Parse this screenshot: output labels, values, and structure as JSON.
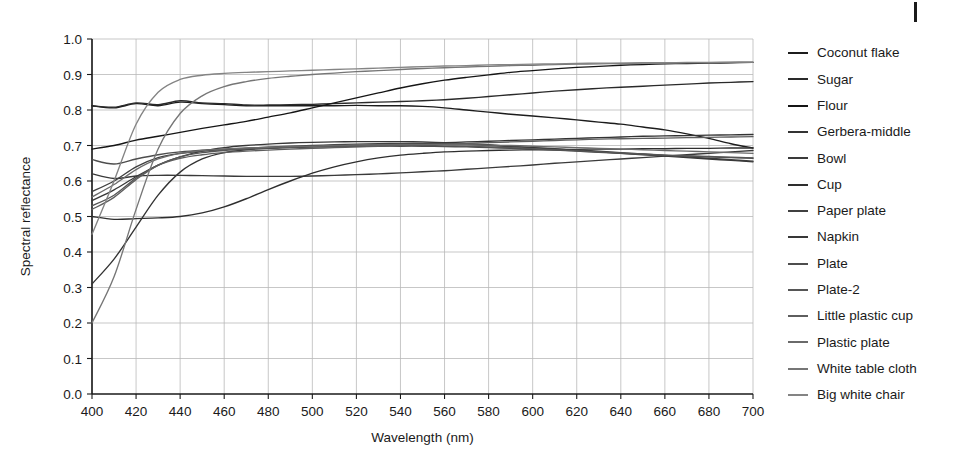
{
  "chart_data": {
    "type": "line",
    "title": "",
    "xlabel": "Wavelength (nm)",
    "ylabel": "Spectral reflectance",
    "xlim": [
      400,
      700
    ],
    "ylim": [
      0.0,
      1.0
    ],
    "grid": true,
    "legend_position": "right",
    "xticks": [
      400,
      420,
      440,
      460,
      480,
      500,
      520,
      540,
      560,
      580,
      600,
      620,
      640,
      660,
      680,
      700
    ],
    "yticks": [
      "0.0",
      "0.1",
      "0.2",
      "0.3",
      "0.4",
      "0.5",
      "0.6",
      "0.7",
      "0.8",
      "0.9",
      "1.0"
    ],
    "x": [
      400,
      410,
      420,
      430,
      440,
      450,
      460,
      470,
      480,
      490,
      500,
      510,
      520,
      530,
      540,
      550,
      560,
      570,
      580,
      590,
      600,
      610,
      620,
      630,
      640,
      650,
      660,
      670,
      680,
      690,
      700
    ],
    "series": [
      {
        "name": "Coconut flake",
        "color": "#1c1c1c",
        "values": [
          0.812,
          0.806,
          0.818,
          0.812,
          0.822,
          0.818,
          0.815,
          0.812,
          0.812,
          0.812,
          0.812,
          0.812,
          0.813,
          0.812,
          0.812,
          0.81,
          0.806,
          0.8,
          0.794,
          0.788,
          0.783,
          0.778,
          0.772,
          0.766,
          0.76,
          0.752,
          0.744,
          0.733,
          0.72,
          0.705,
          0.693
        ]
      },
      {
        "name": "Sugar",
        "color": "#2a2a2a",
        "values": [
          0.812,
          0.808,
          0.82,
          0.815,
          0.826,
          0.82,
          0.818,
          0.814,
          0.814,
          0.815,
          0.816,
          0.818,
          0.82,
          0.822,
          0.824,
          0.826,
          0.829,
          0.833,
          0.838,
          0.843,
          0.848,
          0.853,
          0.857,
          0.861,
          0.864,
          0.867,
          0.87,
          0.873,
          0.876,
          0.878,
          0.88
        ]
      },
      {
        "name": "Flour",
        "color": "#151515",
        "values": [
          0.69,
          0.7,
          0.715,
          0.726,
          0.737,
          0.748,
          0.758,
          0.768,
          0.78,
          0.792,
          0.806,
          0.82,
          0.834,
          0.848,
          0.862,
          0.874,
          0.884,
          0.892,
          0.899,
          0.906,
          0.911,
          0.916,
          0.92,
          0.923,
          0.926,
          0.928,
          0.93,
          0.931,
          0.932,
          0.933,
          0.934
        ]
      },
      {
        "name": "Gerbera-middle",
        "color": "#333333",
        "values": [
          0.31,
          0.38,
          0.47,
          0.56,
          0.625,
          0.662,
          0.68,
          0.688,
          0.692,
          0.694,
          0.696,
          0.698,
          0.7,
          0.702,
          0.704,
          0.706,
          0.708,
          0.71,
          0.712,
          0.714,
          0.716,
          0.718,
          0.72,
          0.722,
          0.724,
          0.726,
          0.727,
          0.728,
          0.729,
          0.73,
          0.731
        ]
      },
      {
        "name": "Bowl",
        "color": "#3a3a3a",
        "values": [
          0.62,
          0.607,
          0.614,
          0.616,
          0.616,
          0.615,
          0.614,
          0.613,
          0.613,
          0.613,
          0.614,
          0.616,
          0.618,
          0.62,
          0.623,
          0.626,
          0.629,
          0.633,
          0.637,
          0.641,
          0.645,
          0.65,
          0.654,
          0.658,
          0.662,
          0.666,
          0.67,
          0.674,
          0.678,
          0.682,
          0.686
        ]
      },
      {
        "name": "Cup",
        "color": "#2e2e2e",
        "values": [
          0.5,
          0.492,
          0.494,
          0.496,
          0.5,
          0.51,
          0.527,
          0.55,
          0.576,
          0.6,
          0.622,
          0.64,
          0.654,
          0.665,
          0.673,
          0.678,
          0.682,
          0.684,
          0.686,
          0.687,
          0.688,
          0.688,
          0.689,
          0.69,
          0.69,
          0.691,
          0.691,
          0.692,
          0.692,
          0.693,
          0.693
        ]
      },
      {
        "name": "Paper plate",
        "color": "#404040",
        "values": [
          0.57,
          0.6,
          0.64,
          0.666,
          0.678,
          0.684,
          0.688,
          0.692,
          0.695,
          0.698,
          0.7,
          0.702,
          0.704,
          0.705,
          0.706,
          0.706,
          0.705,
          0.703,
          0.7,
          0.697,
          0.694,
          0.691,
          0.688,
          0.684,
          0.68,
          0.676,
          0.672,
          0.668,
          0.664,
          0.66,
          0.656
        ]
      },
      {
        "name": "Napkin",
        "color": "#383838",
        "values": [
          0.545,
          0.575,
          0.612,
          0.645,
          0.668,
          0.684,
          0.694,
          0.7,
          0.704,
          0.707,
          0.709,
          0.71,
          0.711,
          0.711,
          0.711,
          0.71,
          0.708,
          0.705,
          0.702,
          0.698,
          0.694,
          0.69,
          0.686,
          0.682,
          0.678,
          0.674,
          0.67,
          0.666,
          0.662,
          0.658,
          0.654
        ]
      },
      {
        "name": "Plate",
        "color": "#4d4d4d",
        "values": [
          0.66,
          0.648,
          0.662,
          0.674,
          0.682,
          0.687,
          0.69,
          0.692,
          0.694,
          0.695,
          0.696,
          0.697,
          0.697,
          0.698,
          0.698,
          0.698,
          0.697,
          0.696,
          0.694,
          0.692,
          0.69,
          0.687,
          0.684,
          0.681,
          0.678,
          0.675,
          0.672,
          0.67,
          0.668,
          0.666,
          0.664
        ]
      },
      {
        "name": "Plate-2",
        "color": "#565656",
        "values": [
          0.53,
          0.56,
          0.608,
          0.645,
          0.668,
          0.68,
          0.686,
          0.69,
          0.693,
          0.695,
          0.697,
          0.698,
          0.699,
          0.7,
          0.7,
          0.7,
          0.699,
          0.698,
          0.696,
          0.694,
          0.691,
          0.688,
          0.685,
          0.682,
          0.679,
          0.676,
          0.673,
          0.671,
          0.669,
          0.667,
          0.665
        ]
      },
      {
        "name": "Little plastic cup",
        "color": "#5e5e5e",
        "values": [
          0.52,
          0.554,
          0.604,
          0.644,
          0.664,
          0.674,
          0.68,
          0.684,
          0.687,
          0.69,
          0.692,
          0.694,
          0.696,
          0.698,
          0.7,
          0.702,
          0.704,
          0.706,
          0.708,
          0.71,
          0.712,
          0.714,
          0.716,
          0.718,
          0.719,
          0.72,
          0.721,
          0.722,
          0.723,
          0.724,
          0.725
        ]
      },
      {
        "name": "Plastic plate",
        "color": "#6a6a6a",
        "values": [
          0.555,
          0.59,
          0.632,
          0.662,
          0.678,
          0.686,
          0.69,
          0.693,
          0.695,
          0.697,
          0.698,
          0.7,
          0.701,
          0.702,
          0.703,
          0.703,
          0.703,
          0.702,
          0.701,
          0.7,
          0.698,
          0.696,
          0.694,
          0.692,
          0.69,
          0.688,
          0.686,
          0.684,
          0.682,
          0.68,
          0.678
        ]
      },
      {
        "name": "White table cloth",
        "color": "#767676",
        "values": [
          0.2,
          0.33,
          0.52,
          0.69,
          0.79,
          0.84,
          0.866,
          0.88,
          0.889,
          0.895,
          0.9,
          0.904,
          0.908,
          0.911,
          0.914,
          0.917,
          0.919,
          0.921,
          0.923,
          0.925,
          0.926,
          0.928,
          0.929,
          0.93,
          0.931,
          0.932,
          0.932,
          0.933,
          0.933,
          0.934,
          0.934
        ]
      },
      {
        "name": "Big white chair",
        "color": "#848484",
        "values": [
          0.45,
          0.6,
          0.76,
          0.85,
          0.886,
          0.898,
          0.903,
          0.906,
          0.908,
          0.91,
          0.912,
          0.914,
          0.916,
          0.918,
          0.92,
          0.922,
          0.924,
          0.925,
          0.927,
          0.928,
          0.929,
          0.93,
          0.931,
          0.932,
          0.932,
          0.933,
          0.933,
          0.934,
          0.934,
          0.935,
          0.935
        ]
      }
    ]
  },
  "legend": {
    "items": [
      {
        "label": "Coconut flake"
      },
      {
        "label": "Sugar"
      },
      {
        "label": "Flour"
      },
      {
        "label": "Gerbera-middle"
      },
      {
        "label": "Bowl"
      },
      {
        "label": "Cup"
      },
      {
        "label": "Paper plate"
      },
      {
        "label": "Napkin"
      },
      {
        "label": "Plate"
      },
      {
        "label": "Plate-2"
      },
      {
        "label": "Little plastic cup"
      },
      {
        "label": "Plastic plate"
      },
      {
        "label": "White table cloth"
      },
      {
        "label": "Big white chair"
      }
    ]
  }
}
